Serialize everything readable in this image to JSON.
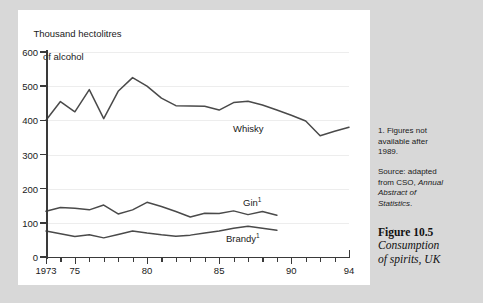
{
  "chart_data": {
    "type": "line",
    "title": "Thousand hectolitres of alcohol",
    "title_line1": "Thousand hectolitres",
    "title_line2": "of alcohol",
    "xlabel": "",
    "ylabel": "Thousand hectolitres of alcohol",
    "ylim": [
      0,
      600
    ],
    "xlim": [
      1973,
      1994
    ],
    "yticks": [
      0,
      100,
      200,
      300,
      400,
      500,
      600
    ],
    "ytick_labels": [
      "0",
      "100",
      "200",
      "300",
      "400",
      "500",
      "600"
    ],
    "xticks": [
      1973,
      1974,
      1975,
      1976,
      1977,
      1978,
      1979,
      1980,
      1981,
      1982,
      1983,
      1984,
      1985,
      1986,
      1987,
      1988,
      1989,
      1990,
      1991,
      1992,
      1993,
      1994
    ],
    "xtick_labels": [
      {
        "x": 1973,
        "label": "1973"
      },
      {
        "x": 1975,
        "label": "75"
      },
      {
        "x": 1980,
        "label": "80"
      },
      {
        "x": 1985,
        "label": "85"
      },
      {
        "x": 1990,
        "label": "90"
      },
      {
        "x": 1994,
        "label": "94"
      }
    ],
    "grid": true,
    "legend": "inline-labels",
    "x": [
      1973,
      1974,
      1975,
      1976,
      1977,
      1978,
      1979,
      1980,
      1981,
      1982,
      1983,
      1984,
      1985,
      1986,
      1987,
      1988,
      1989,
      1990,
      1991,
      1992,
      1993,
      1994
    ],
    "series": [
      {
        "name": "Whisky",
        "label": "Whisky",
        "footnote_marker": "",
        "x": [
          1973,
          1974,
          1975,
          1976,
          1977,
          1978,
          1979,
          1980,
          1981,
          1982,
          1983,
          1984,
          1985,
          1986,
          1987,
          1988,
          1989,
          1990,
          1991,
          1992,
          1993,
          1994
        ],
        "values": [
          400,
          455,
          425,
          490,
          405,
          485,
          525,
          500,
          465,
          443,
          442,
          441,
          430,
          452,
          456,
          445,
          430,
          415,
          398,
          355,
          368,
          380
        ]
      },
      {
        "name": "Gin",
        "label": "Gin",
        "footnote_marker": "1",
        "x": [
          1973,
          1974,
          1975,
          1976,
          1977,
          1978,
          1979,
          1980,
          1981,
          1982,
          1983,
          1984,
          1985,
          1986,
          1987,
          1988,
          1989
        ],
        "values": [
          134,
          145,
          143,
          138,
          152,
          126,
          138,
          160,
          148,
          133,
          117,
          128,
          127,
          135,
          124,
          133,
          122
        ]
      },
      {
        "name": "Brandy",
        "label": "Brandy",
        "footnote_marker": "1",
        "x": [
          1973,
          1974,
          1975,
          1976,
          1977,
          1978,
          1979,
          1980,
          1981,
          1982,
          1983,
          1984,
          1985,
          1986,
          1987,
          1988,
          1989
        ],
        "values": [
          76,
          68,
          60,
          65,
          56,
          66,
          76,
          70,
          65,
          61,
          64,
          70,
          76,
          84,
          90,
          84,
          78
        ]
      }
    ],
    "annotations": {
      "footnote": "1. Figures not available after 1989.",
      "source": "Source: adapted from CSO, Annual Abstract of Statistics."
    }
  },
  "notes": {
    "footnote_line1": "1. Figures not",
    "footnote_line2": "available after",
    "footnote_line3": "1989.",
    "source_prefix": "Source: adapted",
    "source_line2": "from CSO, ",
    "source_italic1": "Annual",
    "source_italic2": "Abstract of",
    "source_italic3": "Statistics",
    "source_period": "."
  },
  "figure": {
    "number": "Figure 10.5",
    "title_line1": "Consumption",
    "title_line2": "of spirits, UK"
  }
}
